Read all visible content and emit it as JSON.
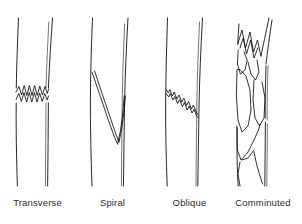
{
  "figure": {
    "background_color": "#ffffff",
    "line_color": "#111111",
    "label_color": "#2b2b2b"
  },
  "panels": [
    {
      "id": "transverse",
      "label": "Transverse",
      "fracture_pattern": "horizontal jagged zigzag break across the full width of the shaft",
      "fracture_position": "mid-shaft"
    },
    {
      "id": "spiral",
      "label": "Spiral",
      "fracture_pattern": "long V-shaped double line twisting down and back up the shaft",
      "fracture_position": "mid to lower shaft"
    },
    {
      "id": "oblique",
      "label": "Oblique",
      "fracture_pattern": "jagged diagonal break angled from upper left to lower right",
      "fracture_position": "mid-shaft"
    },
    {
      "id": "comminuted",
      "label": "Comminuted",
      "fracture_pattern": "multiple splintered fragments with sharp angular spikes",
      "fracture_position": "upper and mid shaft"
    }
  ]
}
